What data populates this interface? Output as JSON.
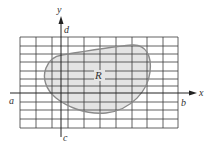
{
  "diagram": {
    "labels": {
      "x_axis": "x",
      "y_axis": "y",
      "a": "a",
      "b": "b",
      "c": "c",
      "d": "d",
      "region": "R"
    },
    "colors": {
      "grid": "#3a3a3a",
      "grid_light": "#9a9a9a",
      "axes": "#222222",
      "region_fill": "#e4e4e4",
      "region_stroke": "#8a8a8a",
      "text": "#333333"
    },
    "grid": {
      "columns": 10,
      "rows": 11
    }
  }
}
